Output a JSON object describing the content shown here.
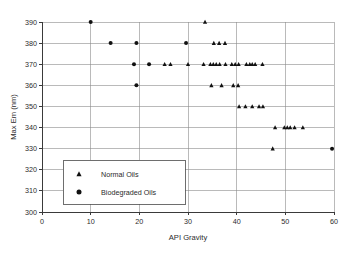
{
  "chart_data": {
    "type": "scatter",
    "title": "",
    "xlabel": "API Gravity",
    "ylabel": "Max Em (nm)",
    "xlim": [
      0,
      60
    ],
    "ylim": [
      300,
      390
    ],
    "xticks": [
      0,
      10,
      20,
      30,
      40,
      50,
      60
    ],
    "yticks": [
      300,
      310,
      320,
      330,
      340,
      350,
      360,
      370,
      380,
      390
    ],
    "grid": true,
    "legend_position": "lower-left-inside",
    "series": [
      {
        "name": "Normal Oils",
        "marker": "triangle",
        "color": "#111111",
        "points": [
          [
            33.5,
            390
          ],
          [
            35.3,
            380
          ],
          [
            36.4,
            380
          ],
          [
            37.6,
            380
          ],
          [
            25.2,
            370
          ],
          [
            26.4,
            370
          ],
          [
            30.0,
            370
          ],
          [
            33.2,
            370
          ],
          [
            34.6,
            370
          ],
          [
            35.2,
            370
          ],
          [
            35.8,
            370
          ],
          [
            36.5,
            370
          ],
          [
            37.7,
            370
          ],
          [
            39.0,
            370
          ],
          [
            39.7,
            370
          ],
          [
            40.4,
            370
          ],
          [
            42.0,
            370
          ],
          [
            42.7,
            370
          ],
          [
            43.2,
            370
          ],
          [
            43.8,
            370
          ],
          [
            45.3,
            370
          ],
          [
            34.8,
            360
          ],
          [
            36.9,
            360
          ],
          [
            39.3,
            360
          ],
          [
            40.3,
            360
          ],
          [
            40.5,
            350
          ],
          [
            41.8,
            350
          ],
          [
            43.2,
            350
          ],
          [
            44.6,
            350
          ],
          [
            45.4,
            350
          ],
          [
            47.9,
            340
          ],
          [
            49.8,
            340
          ],
          [
            50.4,
            340
          ],
          [
            51.0,
            340
          ],
          [
            51.9,
            340
          ],
          [
            53.6,
            340
          ],
          [
            47.4,
            330
          ]
        ]
      },
      {
        "name": "Biodegraded Oils",
        "marker": "circle",
        "color": "#111111",
        "points": [
          [
            10.0,
            390
          ],
          [
            14.1,
            380
          ],
          [
            19.4,
            380
          ],
          [
            29.6,
            380
          ],
          [
            18.9,
            370
          ],
          [
            22.0,
            370
          ],
          [
            19.4,
            360
          ],
          [
            59.6,
            330
          ]
        ]
      }
    ]
  },
  "legend": {
    "entries": [
      {
        "label": "Normal Oils",
        "marker": "triangle-icon"
      },
      {
        "label": "Biodegraded Oils",
        "marker": "circle-icon"
      }
    ]
  }
}
